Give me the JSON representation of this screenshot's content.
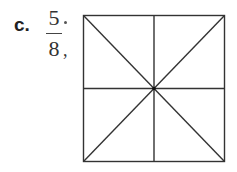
{
  "problem": {
    "label": "c.",
    "fraction": {
      "numerator": "5",
      "denominator": "8"
    },
    "trailing_punct": ","
  },
  "figure": {
    "shape": "square",
    "divisions": 8,
    "lines": [
      "vertical-midline",
      "horizontal-midline",
      "diagonal-tl-br",
      "diagonal-tr-bl"
    ],
    "shaded_parts": 0,
    "stroke_color": "#333333"
  }
}
